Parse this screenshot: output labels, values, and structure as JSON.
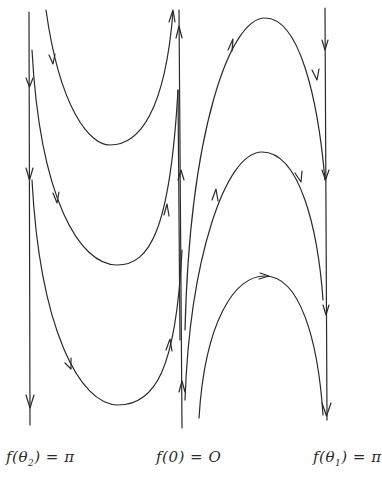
{
  "figure": {
    "type": "phase-portrait",
    "stroke_color": "#2a2a2a",
    "background": "#ffffff"
  },
  "labels": {
    "left": {
      "prefix": "f(θ",
      "sub": "2",
      "suffix": ") = π"
    },
    "center": {
      "text": "f(0) = O"
    },
    "right": {
      "prefix": "f(θ",
      "sub": "1",
      "suffix": ") = π"
    }
  },
  "separatrices": [
    {
      "name": "left-vertical",
      "x": 30,
      "direction": "down"
    },
    {
      "name": "center-vertical",
      "x": 182,
      "direction": "up"
    },
    {
      "name": "right-vertical",
      "x": 325,
      "direction": "down"
    }
  ],
  "trajectories": [
    {
      "name": "u-curve-1",
      "shape": "U",
      "direction": "down-then-up"
    },
    {
      "name": "u-curve-2",
      "shape": "U",
      "direction": "down-then-up"
    },
    {
      "name": "u-curve-3",
      "shape": "U",
      "direction": "down-then-up"
    },
    {
      "name": "arch-1",
      "shape": "arch",
      "direction": "up-then-down"
    },
    {
      "name": "arch-2",
      "shape": "arch",
      "direction": "up-then-down"
    },
    {
      "name": "arch-3",
      "shape": "arch",
      "direction": "up-then-down"
    }
  ]
}
